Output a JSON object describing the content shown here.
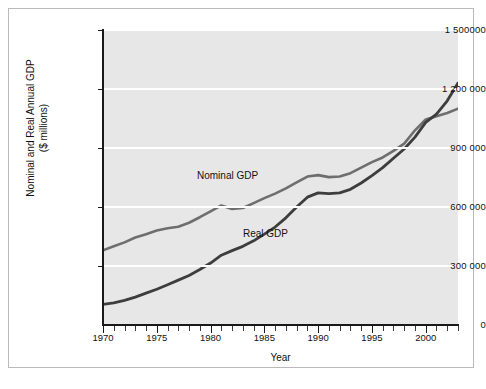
{
  "figure": {
    "background": "#ffffff",
    "panel_color": "#e7e7e7",
    "grid_color": "#ffffff",
    "axis_color": "#1a1a1a"
  },
  "chart_data": {
    "type": "line",
    "title": "",
    "xlabel": "Year",
    "ylabel": "Nominal and Real Annual GDP ($ millions)",
    "ylabel_line1": "Nominal and Real Annual GDP",
    "ylabel_line2": "($ millions)",
    "xlim": [
      1970,
      2003
    ],
    "ylim": [
      0,
      1500000
    ],
    "grid": true,
    "grid_axis": "y",
    "legend": "inline-annotations",
    "ytick_labels": [
      "0",
      "300 000",
      "600 000",
      "900 000",
      "1 200 000",
      "1 500000"
    ],
    "ytick_values": [
      0,
      300000,
      600000,
      900000,
      1200000,
      1500000
    ],
    "xtick_labels": [
      "1970",
      "1975",
      "1980",
      "1985",
      "1990",
      "1995",
      "2000"
    ],
    "xtick_values": [
      1970,
      1975,
      1980,
      1985,
      1990,
      1995,
      2000
    ],
    "x": [
      1970,
      1971,
      1972,
      1973,
      1974,
      1975,
      1976,
      1977,
      1978,
      1979,
      1980,
      1981,
      1982,
      1983,
      1984,
      1985,
      1986,
      1987,
      1988,
      1989,
      1990,
      1991,
      1992,
      1993,
      1994,
      1995,
      1996,
      1997,
      1998,
      1999,
      2000,
      2001,
      2002,
      2003
    ],
    "series": [
      {
        "name": "Nominal GDP",
        "color": "#6e6e6e",
        "label_text": "Nominal GDP",
        "values": [
          380000,
          400000,
          420000,
          445000,
          462000,
          480000,
          492000,
          500000,
          520000,
          548000,
          578000,
          608000,
          590000,
          595000,
          620000,
          645000,
          668000,
          695000,
          725000,
          755000,
          762000,
          752000,
          755000,
          772000,
          800000,
          828000,
          852000,
          885000,
          922000,
          990000,
          1045000,
          1062000,
          1078000,
          1100000
        ]
      },
      {
        "name": "Real GDP",
        "color": "#3d3d3d",
        "label_text": "Real GDP",
        "values": [
          105000,
          112000,
          125000,
          142000,
          162000,
          182000,
          205000,
          228000,
          252000,
          282000,
          315000,
          355000,
          378000,
          400000,
          428000,
          462000,
          498000,
          545000,
          600000,
          650000,
          672000,
          668000,
          672000,
          690000,
          722000,
          760000,
          800000,
          848000,
          895000,
          955000,
          1030000,
          1072000,
          1140000,
          1230000
        ]
      }
    ],
    "annotations": [
      {
        "text": "Nominal GDP",
        "x": 1984,
        "y": 800000
      },
      {
        "text": "Real GDP",
        "x": 1988,
        "y": 470000
      }
    ]
  }
}
